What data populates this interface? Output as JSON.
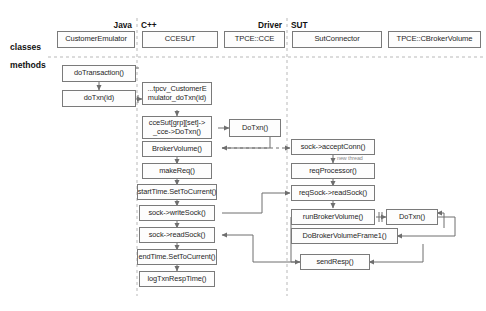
{
  "diagram": {
    "row_labels": [
      {
        "id": "classes",
        "text": "classes"
      },
      {
        "id": "methods",
        "text": "methods"
      }
    ],
    "columns": [
      {
        "id": "java",
        "label": "Java",
        "align": "right"
      },
      {
        "id": "cpp",
        "label": "C++",
        "align": "left"
      },
      {
        "id": "driver",
        "label": "Driver",
        "align": "right"
      },
      {
        "id": "sut",
        "label": "SUT",
        "align": "left"
      }
    ],
    "classes": [
      {
        "id": "customer-emulator",
        "label": "CustomerEmulator",
        "column": "java"
      },
      {
        "id": "ccesut",
        "label": "CCESUT",
        "column": "cpp"
      },
      {
        "id": "tpce-cce",
        "label": "TPCE::CCE",
        "column": "driver"
      },
      {
        "id": "sut-connector",
        "label": "SutConnector",
        "column": "sut"
      },
      {
        "id": "tpce-cbrokervolume",
        "label": "TPCE::CBrokerVolume",
        "column": "sut"
      }
    ],
    "methods": [
      {
        "id": "do-transaction",
        "label": "doTransaction()",
        "column": "java"
      },
      {
        "id": "do-txn-id",
        "label": "doTxn(id)",
        "column": "java"
      },
      {
        "id": "jni-tpcv-customeremulator",
        "label": "...tpcv_CustomerE\nmulator_doTxn(id)",
        "column": "cpp"
      },
      {
        "id": "ccesut-grp-set-dotxn",
        "label": "cceSut[grp][set]->\n_cce->DoTxn()",
        "column": "cpp"
      },
      {
        "id": "broker-volume",
        "label": "BrokerVolume()",
        "column": "cpp"
      },
      {
        "id": "make-req",
        "label": "makeReq()",
        "column": "cpp"
      },
      {
        "id": "start-time-settocurrent",
        "label": "startTime.SetToCurrent()",
        "column": "cpp"
      },
      {
        "id": "sock-writesock",
        "label": "sock->writeSock()",
        "column": "cpp"
      },
      {
        "id": "sock-readsock",
        "label": "sock->readSock()",
        "column": "cpp"
      },
      {
        "id": "end-time-settocurrent",
        "label": "endTime.SetToCurrent()",
        "column": "cpp"
      },
      {
        "id": "log-txn-resptime",
        "label": "logTxnRespTime()",
        "column": "cpp"
      },
      {
        "id": "driver-dotxn",
        "label": "DoTxn()",
        "column": "driver"
      },
      {
        "id": "sock-acceptconn",
        "label": "sock->acceptConn()",
        "column": "sut"
      },
      {
        "id": "req-processor",
        "label": "reqProcessor()",
        "column": "sut"
      },
      {
        "id": "reqsock-readsock",
        "label": "reqSock->readSock()",
        "column": "sut"
      },
      {
        "id": "run-broker-volume",
        "label": "runBrokerVolume()",
        "column": "sut"
      },
      {
        "id": "sut-dotxn",
        "label": "DoTxn()",
        "column": "sut"
      },
      {
        "id": "dobrokervolumeframe1",
        "label": "DoBrokerVolumeFrame1()",
        "column": "sut"
      },
      {
        "id": "send-resp",
        "label": "sendResp()",
        "column": "sut"
      }
    ],
    "annotations": [
      {
        "id": "new-thread",
        "label": "new thread"
      }
    ],
    "colors": {
      "box_border": "#7a7a7a",
      "box_fill": "#fdfdfd",
      "connector": "#6e6e6e",
      "divider": "#b9b9b9",
      "text": "#1f1f1f",
      "annotation_text": "#8a8a8a"
    }
  }
}
